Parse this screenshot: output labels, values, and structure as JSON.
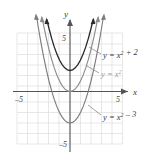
{
  "figure": {
    "name": "parabola-family-graph",
    "background": "#ffffff",
    "grid_color": "#d9d9d9",
    "axis_color": "#4a4a4a"
  },
  "axes": {
    "x_label": "x",
    "y_label": "y",
    "x_tick_left": "–5",
    "x_tick_right": "5",
    "y_tick_top": "5",
    "y_tick_bottom": "–5",
    "x_range": [
      -6,
      6
    ],
    "y_range": [
      -6,
      6
    ]
  },
  "chart_data": {
    "type": "line",
    "title": "",
    "xlabel": "x",
    "ylabel": "y",
    "xlim": [
      -6,
      6
    ],
    "ylim": [
      -6,
      6
    ],
    "grid": true,
    "legend": "inline-annotations",
    "series": [
      {
        "name": "y = x² + 2",
        "label": "y = x² + 2",
        "color": "#2b2b2b",
        "vertex": [
          0,
          2
        ],
        "equation": "y = x^2 + 2",
        "x": [
          -2.2,
          -2.0,
          -1.75,
          -1.5,
          -1.25,
          -1.0,
          -0.75,
          -0.5,
          -0.25,
          0,
          0.25,
          0.5,
          0.75,
          1.0,
          1.25,
          1.5,
          1.75,
          2.0,
          2.2
        ],
        "values": [
          6.84,
          6.0,
          5.06,
          4.25,
          3.56,
          3.0,
          2.56,
          2.25,
          2.06,
          2.0,
          2.06,
          2.25,
          2.56,
          3.0,
          3.56,
          4.25,
          5.06,
          6.0,
          6.84
        ]
      },
      {
        "name": "y = x²",
        "label": "y = x²",
        "color": "#8c8c8c",
        "vertex": [
          0,
          0
        ],
        "equation": "y = x^2",
        "x": [
          -2.65,
          -2.5,
          -2.25,
          -2.0,
          -1.75,
          -1.5,
          -1.25,
          -1.0,
          -0.75,
          -0.5,
          -0.25,
          0,
          0.25,
          0.5,
          0.75,
          1.0,
          1.25,
          1.5,
          1.75,
          2.0,
          2.25,
          2.5,
          2.65
        ],
        "values": [
          7.02,
          6.25,
          5.06,
          4.0,
          3.06,
          2.25,
          1.56,
          1.0,
          0.56,
          0.25,
          0.06,
          0,
          0.06,
          0.25,
          0.56,
          1.0,
          1.56,
          2.25,
          3.06,
          4.0,
          5.06,
          6.25,
          7.02
        ]
      },
      {
        "name": "y = x² – 3",
        "label": "y = x² – 3",
        "color": "#7d7d7d",
        "vertex": [
          0,
          -3
        ],
        "equation": "y = x^2 - 3",
        "x": [
          -3.2,
          -3.0,
          -2.75,
          -2.5,
          -2.25,
          -2.0,
          -1.75,
          -1.5,
          -1.25,
          -1.0,
          -0.75,
          -0.5,
          -0.25,
          0,
          0.25,
          0.5,
          0.75,
          1.0,
          1.25,
          1.5,
          1.75,
          2.0,
          2.25,
          2.5,
          2.75,
          3.0,
          3.2
        ],
        "values": [
          7.24,
          6.0,
          4.56,
          3.25,
          2.06,
          1.0,
          0.06,
          -0.75,
          -1.44,
          -2.0,
          -2.44,
          -2.75,
          -2.94,
          -3.0,
          -2.94,
          -2.75,
          -2.44,
          -2.0,
          -1.44,
          -0.75,
          0.06,
          1.0,
          2.06,
          3.25,
          4.56,
          6.0,
          7.24
        ]
      }
    ]
  },
  "annotations": [
    {
      "id": "ann-top",
      "text": "y = x² + 2"
    },
    {
      "id": "ann-middle",
      "text": "y = x²"
    },
    {
      "id": "ann-bottom",
      "text": "y = x² – 3"
    }
  ]
}
